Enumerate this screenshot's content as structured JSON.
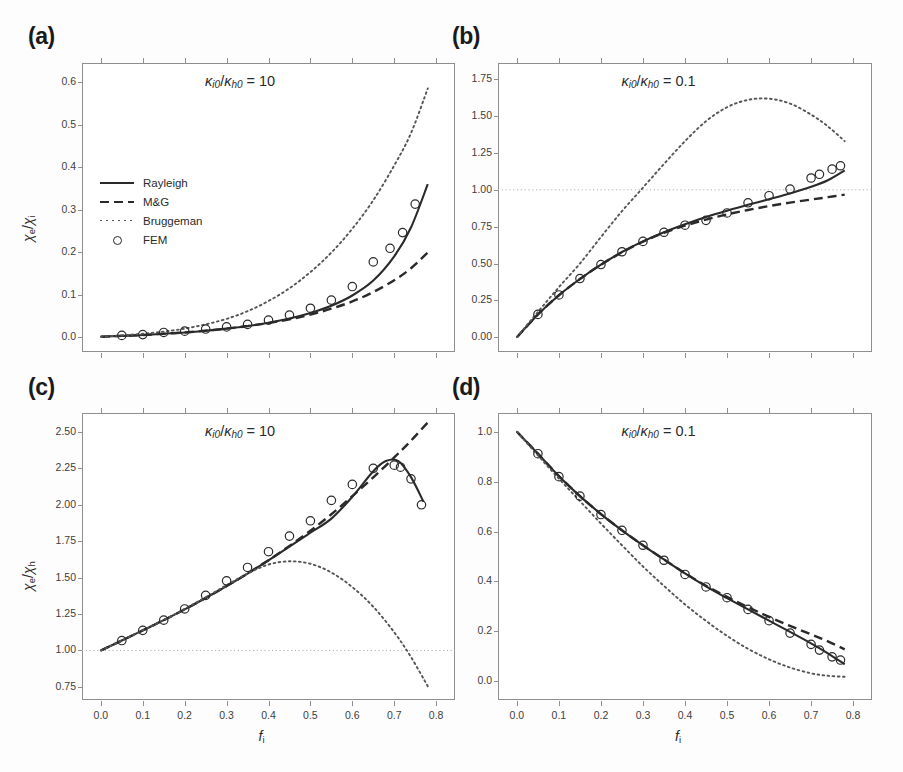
{
  "figure": {
    "xlabel": "f",
    "xlabel_sub": "i",
    "panels": [
      {
        "key": "a",
        "label": "(a)",
        "annotation_prefix": "κ",
        "annotation": "κᵢ₀/κₕ₀ = 10",
        "annotation_num": "K",
        "annotation_sub1": "i0",
        "annotation_sub2": "h0",
        "annotation_value": "10",
        "ylabel_main": "χ",
        "ylabel_sub1": "e",
        "ylabel_sub2": "i",
        "ylabel": "χe/χi",
        "yticks": [
          "0.0",
          "0.1",
          "0.2",
          "0.3",
          "0.4",
          "0.5",
          "0.6"
        ],
        "ytick_values": [
          0.0,
          0.1,
          0.2,
          0.3,
          0.4,
          0.5,
          0.6
        ],
        "xticks": [],
        "xtick_values": [
          0.0,
          0.1,
          0.2,
          0.3,
          0.4,
          0.5,
          0.6,
          0.7,
          0.8
        ],
        "ylim": [
          -0.035,
          0.645
        ],
        "xlim": [
          -0.045,
          0.845
        ],
        "has_unity_line": false,
        "show_legend": true
      },
      {
        "key": "b",
        "label": "(b)",
        "annotation": "κᵢ₀/κₕ₀ = 0.1",
        "annotation_value": "0.1",
        "ylabel": "",
        "yticks": [
          "0.00",
          "0.25",
          "0.50",
          "0.75",
          "1.00",
          "1.25",
          "1.50",
          "1.75"
        ],
        "ytick_values": [
          0.0,
          0.25,
          0.5,
          0.75,
          1.0,
          1.25,
          1.5,
          1.75
        ],
        "xticks": [],
        "xtick_values": [
          0.0,
          0.1,
          0.2,
          0.3,
          0.4,
          0.5,
          0.6,
          0.7,
          0.8
        ],
        "ylim": [
          -0.1,
          1.86
        ],
        "xlim": [
          -0.045,
          0.845
        ],
        "has_unity_line": true,
        "unity_value": 1.0,
        "show_legend": false
      },
      {
        "key": "c",
        "label": "(c)",
        "annotation": "κᵢ₀/κₕ₀ = 10",
        "annotation_value": "10",
        "ylabel": "χe/χh",
        "ylabel_main": "χ",
        "ylabel_sub1": "e",
        "ylabel_sub2": "h",
        "yticks": [
          "0.75",
          "1.00",
          "1.25",
          "1.50",
          "1.75",
          "2.00",
          "2.25",
          "2.50"
        ],
        "ytick_values": [
          0.75,
          1.0,
          1.25,
          1.5,
          1.75,
          2.0,
          2.25,
          2.5
        ],
        "xticks": [
          "0.0",
          "0.1",
          "0.2",
          "0.3",
          "0.4",
          "0.5",
          "0.6",
          "0.7",
          "0.8"
        ],
        "xtick_values": [
          0.0,
          0.1,
          0.2,
          0.3,
          0.4,
          0.5,
          0.6,
          0.7,
          0.8
        ],
        "ylim": [
          0.66,
          2.63
        ],
        "xlim": [
          -0.045,
          0.845
        ],
        "has_unity_line": true,
        "unity_value": 1.0,
        "show_legend": false
      },
      {
        "key": "d",
        "label": "(d)",
        "annotation": "κᵢ₀/κₕ₀ = 0.1",
        "annotation_value": "0.1",
        "ylabel": "",
        "yticks": [
          "0.0",
          "0.2",
          "0.4",
          "0.6",
          "0.8",
          "1.0"
        ],
        "ytick_values": [
          0.0,
          0.2,
          0.4,
          0.6,
          0.8,
          1.0
        ],
        "xticks": [
          "0.0",
          "0.1",
          "0.2",
          "0.3",
          "0.4",
          "0.5",
          "0.6",
          "0.7",
          "0.8"
        ],
        "xtick_values": [
          0.0,
          0.1,
          0.2,
          0.3,
          0.4,
          0.5,
          0.6,
          0.7,
          0.8
        ],
        "ylim": [
          -0.075,
          1.075
        ],
        "xlim": [
          -0.045,
          0.845
        ],
        "has_unity_line": false,
        "show_legend": false
      }
    ]
  },
  "legend": {
    "items": [
      {
        "label": "Rayleigh",
        "style": "solid"
      },
      {
        "label": "M&G",
        "style": "dashed"
      },
      {
        "label": "Bruggeman",
        "style": "dotted"
      },
      {
        "label": "FEM",
        "style": "circle"
      }
    ]
  },
  "colors": {
    "line": "#2a2a2a",
    "dotted": "#555555",
    "axis": "#8f8f8f",
    "text": "#2b2b2b",
    "unity_line": "#b0b0b0"
  },
  "chart_data": {
    "type": "line",
    "title": "",
    "xlabel": "f_i",
    "panels": [
      {
        "key": "a",
        "ylabel": "chi_e/chi_i",
        "annotation": "kappa_i0/kappa_h0 = 10",
        "xlim": [
          -0.045,
          0.845
        ],
        "ylim": [
          -0.035,
          0.645
        ],
        "grid": false,
        "series": [
          {
            "name": "Rayleigh",
            "style": "solid",
            "x": [
              0.0,
              0.05,
              0.1,
              0.15,
              0.2,
              0.25,
              0.3,
              0.35,
              0.4,
              0.45,
              0.5,
              0.55,
              0.6,
              0.65,
              0.7,
              0.74,
              0.78
            ],
            "y": [
              0.001,
              0.003,
              0.005,
              0.008,
              0.011,
              0.015,
              0.02,
              0.026,
              0.034,
              0.044,
              0.057,
              0.074,
              0.098,
              0.133,
              0.19,
              0.258,
              0.36
            ]
          },
          {
            "name": "M&G",
            "style": "dashed",
            "x": [
              0.0,
              0.05,
              0.1,
              0.15,
              0.2,
              0.25,
              0.3,
              0.35,
              0.4,
              0.45,
              0.5,
              0.55,
              0.6,
              0.65,
              0.7,
              0.74,
              0.78
            ],
            "y": [
              0.001,
              0.003,
              0.005,
              0.008,
              0.011,
              0.015,
              0.02,
              0.026,
              0.033,
              0.042,
              0.053,
              0.067,
              0.084,
              0.106,
              0.134,
              0.162,
              0.199
            ]
          },
          {
            "name": "Bruggeman",
            "style": "dotted",
            "x": [
              0.0,
              0.05,
              0.1,
              0.15,
              0.2,
              0.25,
              0.3,
              0.35,
              0.4,
              0.45,
              0.5,
              0.55,
              0.6,
              0.65,
              0.7,
              0.74,
              0.78
            ],
            "y": [
              0.001,
              0.004,
              0.008,
              0.013,
              0.02,
              0.03,
              0.043,
              0.061,
              0.085,
              0.115,
              0.153,
              0.199,
              0.255,
              0.322,
              0.404,
              0.48,
              0.585
            ]
          },
          {
            "name": "FEM",
            "style": "markers",
            "x": [
              0.05,
              0.1,
              0.15,
              0.2,
              0.25,
              0.3,
              0.35,
              0.4,
              0.45,
              0.5,
              0.55,
              0.6,
              0.65,
              0.69,
              0.72,
              0.75
            ],
            "y": [
              0.004,
              0.006,
              0.011,
              0.014,
              0.019,
              0.024,
              0.03,
              0.04,
              0.052,
              0.068,
              0.087,
              0.119,
              0.177,
              0.209,
              0.246,
              0.313
            ]
          }
        ]
      },
      {
        "key": "b",
        "ylabel": "chi_e/chi_i",
        "annotation": "kappa_i0/kappa_h0 = 0.1",
        "xlim": [
          -0.045,
          0.845
        ],
        "ylim": [
          -0.1,
          1.86
        ],
        "grid": false,
        "unity_line": 1.0,
        "series": [
          {
            "name": "Rayleigh",
            "style": "solid",
            "x": [
              0.0,
              0.05,
              0.1,
              0.15,
              0.2,
              0.25,
              0.3,
              0.35,
              0.4,
              0.45,
              0.5,
              0.55,
              0.6,
              0.65,
              0.7,
              0.74,
              0.78
            ],
            "y": [
              0.0,
              0.155,
              0.285,
              0.395,
              0.492,
              0.578,
              0.65,
              0.712,
              0.766,
              0.815,
              0.858,
              0.898,
              0.936,
              0.975,
              1.02,
              1.065,
              1.132
            ]
          },
          {
            "name": "M&G",
            "style": "dashed",
            "x": [
              0.0,
              0.05,
              0.1,
              0.15,
              0.2,
              0.25,
              0.3,
              0.35,
              0.4,
              0.45,
              0.5,
              0.55,
              0.6,
              0.65,
              0.7,
              0.74,
              0.78
            ],
            "y": [
              0.0,
              0.155,
              0.285,
              0.395,
              0.492,
              0.576,
              0.648,
              0.708,
              0.757,
              0.798,
              0.833,
              0.863,
              0.89,
              0.913,
              0.934,
              0.95,
              0.967
            ]
          },
          {
            "name": "Bruggeman",
            "style": "dotted",
            "x": [
              0.0,
              0.05,
              0.1,
              0.15,
              0.2,
              0.25,
              0.3,
              0.35,
              0.4,
              0.45,
              0.5,
              0.55,
              0.6,
              0.65,
              0.7,
              0.74,
              0.78
            ],
            "y": [
              0.0,
              0.172,
              0.34,
              0.5,
              0.68,
              0.855,
              1.015,
              1.175,
              1.33,
              1.465,
              1.56,
              1.61,
              1.618,
              1.585,
              1.51,
              1.43,
              1.33
            ]
          },
          {
            "name": "FEM",
            "style": "markers",
            "x": [
              0.05,
              0.1,
              0.15,
              0.2,
              0.25,
              0.3,
              0.35,
              0.4,
              0.45,
              0.5,
              0.55,
              0.6,
              0.65,
              0.7,
              0.72,
              0.75,
              0.77
            ],
            "y": [
              0.155,
              0.287,
              0.398,
              0.493,
              0.58,
              0.65,
              0.712,
              0.76,
              0.793,
              0.843,
              0.912,
              0.96,
              1.005,
              1.08,
              1.105,
              1.14,
              1.163
            ]
          }
        ]
      },
      {
        "key": "c",
        "ylabel": "chi_e/chi_h",
        "annotation": "kappa_i0/kappa_h0 = 10",
        "xlim": [
          -0.045,
          0.845
        ],
        "ylim": [
          0.66,
          2.63
        ],
        "grid": false,
        "unity_line": 1.0,
        "series": [
          {
            "name": "Rayleigh",
            "style": "solid",
            "x": [
              0.0,
              0.05,
              0.1,
              0.15,
              0.2,
              0.25,
              0.3,
              0.35,
              0.4,
              0.45,
              0.5,
              0.55,
              0.6,
              0.65,
              0.68,
              0.71,
              0.74,
              0.77
            ],
            "y": [
              1.0,
              1.068,
              1.138,
              1.208,
              1.282,
              1.36,
              1.442,
              1.528,
              1.618,
              1.712,
              1.808,
              1.905,
              2.055,
              2.23,
              2.3,
              2.3,
              2.19,
              2.02
            ]
          },
          {
            "name": "M&G",
            "style": "dashed",
            "x": [
              0.0,
              0.05,
              0.1,
              0.15,
              0.2,
              0.25,
              0.3,
              0.35,
              0.4,
              0.45,
              0.5,
              0.55,
              0.6,
              0.65,
              0.7,
              0.74,
              0.78
            ],
            "y": [
              1.0,
              1.068,
              1.138,
              1.208,
              1.282,
              1.36,
              1.442,
              1.528,
              1.62,
              1.718,
              1.822,
              1.935,
              2.06,
              2.188,
              2.325,
              2.44,
              2.565
            ]
          },
          {
            "name": "Bruggeman",
            "style": "dotted",
            "x": [
              0.0,
              0.05,
              0.1,
              0.15,
              0.2,
              0.25,
              0.3,
              0.35,
              0.4,
              0.45,
              0.5,
              0.55,
              0.6,
              0.65,
              0.7,
              0.74,
              0.78
            ],
            "y": [
              1.0,
              1.068,
              1.138,
              1.208,
              1.285,
              1.365,
              1.448,
              1.528,
              1.59,
              1.612,
              1.595,
              1.535,
              1.435,
              1.3,
              1.125,
              0.955,
              0.755
            ]
          },
          {
            "name": "FEM",
            "style": "markers",
            "x": [
              0.05,
              0.1,
              0.15,
              0.2,
              0.25,
              0.3,
              0.35,
              0.4,
              0.45,
              0.5,
              0.55,
              0.6,
              0.65,
              0.7,
              0.715,
              0.74,
              0.765
            ],
            "y": [
              1.068,
              1.138,
              1.208,
              1.285,
              1.378,
              1.478,
              1.57,
              1.678,
              1.785,
              1.89,
              2.03,
              2.14,
              2.25,
              2.272,
              2.258,
              2.178,
              2.0
            ]
          }
        ]
      },
      {
        "key": "d",
        "ylabel": "chi_e/chi_h",
        "annotation": "kappa_i0/kappa_h0 = 0.1",
        "xlim": [
          -0.045,
          0.845
        ],
        "ylim": [
          -0.075,
          1.075
        ],
        "grid": false,
        "series": [
          {
            "name": "Rayleigh",
            "style": "solid",
            "x": [
              0.0,
              0.05,
              0.1,
              0.15,
              0.2,
              0.25,
              0.3,
              0.35,
              0.4,
              0.45,
              0.5,
              0.55,
              0.6,
              0.65,
              0.7,
              0.74,
              0.78
            ],
            "y": [
              1.0,
              0.912,
              0.822,
              0.742,
              0.67,
              0.605,
              0.545,
              0.488,
              0.432,
              0.38,
              0.333,
              0.288,
              0.243,
              0.198,
              0.152,
              0.112,
              0.068
            ]
          },
          {
            "name": "M&G",
            "style": "dashed",
            "x": [
              0.0,
              0.05,
              0.1,
              0.15,
              0.2,
              0.25,
              0.3,
              0.35,
              0.4,
              0.45,
              0.5,
              0.55,
              0.6,
              0.65,
              0.7,
              0.74,
              0.78
            ],
            "y": [
              1.0,
              0.912,
              0.822,
              0.742,
              0.67,
              0.605,
              0.545,
              0.488,
              0.433,
              0.383,
              0.338,
              0.297,
              0.258,
              0.222,
              0.188,
              0.16,
              0.128
            ]
          },
          {
            "name": "Bruggeman",
            "style": "dotted",
            "x": [
              0.0,
              0.05,
              0.1,
              0.15,
              0.2,
              0.25,
              0.3,
              0.35,
              0.4,
              0.45,
              0.5,
              0.55,
              0.6,
              0.65,
              0.7,
              0.74,
              0.78
            ],
            "y": [
              1.0,
              0.905,
              0.812,
              0.722,
              0.632,
              0.545,
              0.46,
              0.382,
              0.308,
              0.242,
              0.182,
              0.13,
              0.088,
              0.055,
              0.032,
              0.022,
              0.018
            ]
          },
          {
            "name": "FEM",
            "style": "markers",
            "x": [
              0.05,
              0.1,
              0.15,
              0.2,
              0.25,
              0.3,
              0.35,
              0.4,
              0.45,
              0.5,
              0.55,
              0.6,
              0.65,
              0.7,
              0.72,
              0.75,
              0.77
            ],
            "y": [
              0.912,
              0.82,
              0.742,
              0.668,
              0.605,
              0.545,
              0.485,
              0.428,
              0.378,
              0.335,
              0.288,
              0.243,
              0.193,
              0.148,
              0.125,
              0.098,
              0.085
            ]
          }
        ]
      }
    ]
  }
}
